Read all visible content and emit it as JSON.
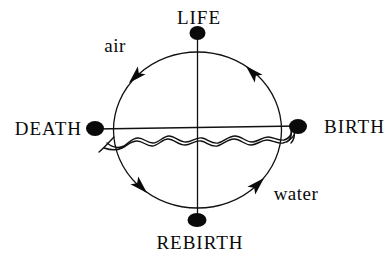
{
  "diagram": {
    "type": "cycle-diagram",
    "nodes": {
      "top": {
        "label": "LIFE"
      },
      "right": {
        "label": "BIRTH"
      },
      "bottom": {
        "label": "REBIRTH"
      },
      "left": {
        "label": "DEATH"
      }
    },
    "regions": {
      "upper": {
        "label": "air"
      },
      "lower": {
        "label": "water"
      }
    },
    "cycle": {
      "direction": "counterclockwise",
      "sequence": [
        "BIRTH",
        "LIFE",
        "DEATH",
        "REBIRTH"
      ],
      "arrow_count": 4
    },
    "icons": {
      "node_marker": "filled-dot",
      "divider": "double-wavy-waterline"
    },
    "colors": {
      "ink": "#0a0a0a",
      "background": "#ffffff"
    }
  }
}
